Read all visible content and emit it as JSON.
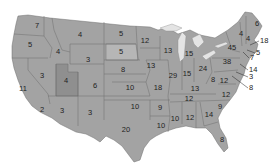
{
  "map": {
    "subject": "United States electoral votes by state",
    "colors": {
      "state_fill": "#a3a3a3",
      "state_fill_dark": "#8f8f8f",
      "state_fill_light": "#b6b6b6",
      "border": "#6f6f6f",
      "lakes": "#e4e4e4",
      "background": "#ffffff"
    },
    "states": [
      {
        "name": "Washington",
        "value": "7",
        "x": 37,
        "y": 26
      },
      {
        "name": "Oregon",
        "value": "5",
        "x": 30,
        "y": 45
      },
      {
        "name": "California",
        "value": "11",
        "x": 23,
        "y": 89
      },
      {
        "name": "California South",
        "value": "2",
        "x": 42,
        "y": 110
      },
      {
        "name": "Nevada",
        "value": "3",
        "x": 42,
        "y": 76
      },
      {
        "name": "Idaho",
        "value": "4",
        "x": 58,
        "y": 52
      },
      {
        "name": "Montana",
        "value": "4",
        "x": 80,
        "y": 35
      },
      {
        "name": "Wyoming",
        "value": "3",
        "x": 88,
        "y": 60
      },
      {
        "name": "Utah",
        "value": "4",
        "x": 66,
        "y": 81
      },
      {
        "name": "Colorado",
        "value": "6",
        "x": 95,
        "y": 86
      },
      {
        "name": "Arizona",
        "value": "3",
        "x": 62,
        "y": 111
      },
      {
        "name": "New Mexico",
        "value": "3",
        "x": 90,
        "y": 113
      },
      {
        "name": "North Dakota",
        "value": "5",
        "x": 121,
        "y": 34
      },
      {
        "name": "South Dakota",
        "value": "5",
        "x": 121,
        "y": 52
      },
      {
        "name": "Nebraska",
        "value": "8",
        "x": 123,
        "y": 70
      },
      {
        "name": "Kansas",
        "value": "10",
        "x": 130,
        "y": 88
      },
      {
        "name": "Oklahoma",
        "value": "10",
        "x": 135,
        "y": 107
      },
      {
        "name": "Texas",
        "value": "20",
        "x": 126,
        "y": 130
      },
      {
        "name": "Minnesota",
        "value": "12",
        "x": 145,
        "y": 41
      },
      {
        "name": "Iowa",
        "value": "13",
        "x": 151,
        "y": 66
      },
      {
        "name": "Missouri",
        "value": "18",
        "x": 158,
        "y": 88
      },
      {
        "name": "Arkansas",
        "value": "9",
        "x": 160,
        "y": 108
      },
      {
        "name": "Louisiana",
        "value": "10",
        "x": 161,
        "y": 126
      },
      {
        "name": "Wisconsin",
        "value": "13",
        "x": 168,
        "y": 51
      },
      {
        "name": "Illinois",
        "value": "29",
        "x": 173,
        "y": 76
      },
      {
        "name": "Michigan",
        "value": "15",
        "x": 189,
        "y": 54
      },
      {
        "name": "Indiana",
        "value": "15",
        "x": 187,
        "y": 74
      },
      {
        "name": "Ohio",
        "value": "24",
        "x": 203,
        "y": 69
      },
      {
        "name": "Kentucky",
        "value": "13",
        "x": 195,
        "y": 89
      },
      {
        "name": "Tennessee",
        "value": "12",
        "x": 189,
        "y": 99
      },
      {
        "name": "Mississippi",
        "value": "10",
        "x": 175,
        "y": 119
      },
      {
        "name": "Alabama",
        "value": "12",
        "x": 190,
        "y": 118
      },
      {
        "name": "Georgia",
        "value": "14",
        "x": 209,
        "y": 115
      },
      {
        "name": "Florida",
        "value": "8",
        "x": 222,
        "y": 140
      },
      {
        "name": "South Carolina",
        "value": "9",
        "x": 220,
        "y": 107
      },
      {
        "name": "North Carolina",
        "value": "12",
        "x": 226,
        "y": 95
      },
      {
        "name": "Virginia",
        "value": "12",
        "x": 224,
        "y": 81
      },
      {
        "name": "West Virginia",
        "value": "8",
        "x": 213,
        "y": 80
      },
      {
        "name": "Pennsylvania",
        "value": "38",
        "x": 227,
        "y": 62
      },
      {
        "name": "New York",
        "value": "45",
        "x": 232,
        "y": 48
      },
      {
        "name": "Vermont",
        "value": "4",
        "x": 241,
        "y": 34
      },
      {
        "name": "New Hampshire",
        "value": "4",
        "x": 248,
        "y": 39
      },
      {
        "name": "Maine",
        "value": "6",
        "x": 257,
        "y": 24
      }
    ],
    "callouts": [
      {
        "name": "Massachusetts",
        "value": "18",
        "x": 260,
        "y": 41
      },
      {
        "name": "Rhode Island",
        "value": "5",
        "x": 256,
        "y": 53
      },
      {
        "name": "Connecticut",
        "value": "7",
        "x": 250,
        "y": 58
      },
      {
        "name": "New Jersey",
        "value": "14",
        "x": 249,
        "y": 70
      },
      {
        "name": "Delaware",
        "value": "3",
        "x": 249,
        "y": 77
      },
      {
        "name": "Maryland",
        "value": "8",
        "x": 249,
        "y": 88
      }
    ]
  }
}
